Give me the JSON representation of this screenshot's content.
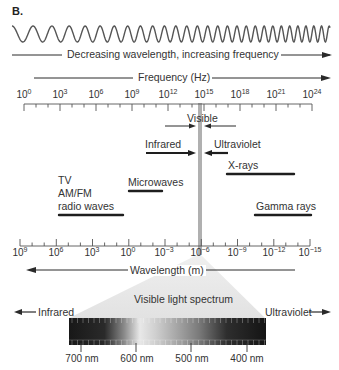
{
  "panel_label": "B.",
  "wave_caption": "Decreasing wavelength, increasing frequency",
  "frequency_axis": {
    "title": "Frequency (Hz)",
    "ticks": [
      {
        "base": "10",
        "exp": "0"
      },
      {
        "base": "10",
        "exp": "3"
      },
      {
        "base": "10",
        "exp": "6"
      },
      {
        "base": "10",
        "exp": "9"
      },
      {
        "base": "10",
        "exp": "12"
      },
      {
        "base": "10",
        "exp": "15"
      },
      {
        "base": "10",
        "exp": "18"
      },
      {
        "base": "10",
        "exp": "21"
      },
      {
        "base": "10",
        "exp": "24"
      }
    ]
  },
  "wavelength_axis": {
    "title": "Wavelength (m)",
    "ticks": [
      {
        "base": "10",
        "exp": "9"
      },
      {
        "base": "10",
        "exp": "6"
      },
      {
        "base": "10",
        "exp": "3"
      },
      {
        "base": "10",
        "exp": "0"
      },
      {
        "base": "10",
        "exp": "−3"
      },
      {
        "base": "10",
        "exp": "−6"
      },
      {
        "base": "10",
        "exp": "−9"
      },
      {
        "base": "10",
        "exp": "−12"
      },
      {
        "base": "10",
        "exp": "−15"
      }
    ]
  },
  "bands": {
    "visible": "Visible",
    "infrared": "Infrared",
    "ultraviolet": "Ultraviolet",
    "xrays": "X-rays",
    "microwaves": "Microwaves",
    "radio_line1": "TV",
    "radio_line2": "AM/FM",
    "radio_line3": "radio waves",
    "gamma": "Gamma rays"
  },
  "spectrum": {
    "title": "Visible light spectrum",
    "left_label": "Infrared",
    "right_label": "Ultraviolet",
    "nm_labels": [
      "700 nm",
      "600 nm",
      "500 nm",
      "400 nm"
    ]
  },
  "colors": {
    "line": "#2a2a2a",
    "visible_bar": "#b0b0b0",
    "fan": "#e6e6e6"
  }
}
